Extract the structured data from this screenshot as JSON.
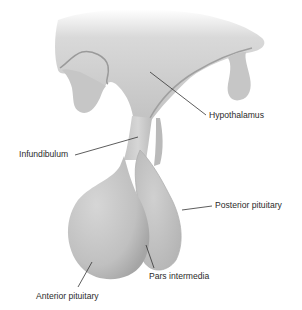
{
  "figure": {
    "type": "anatomical-illustration",
    "labels": {
      "hypothalamus": "Hypothalamus",
      "infundibulum": "Infundibulum",
      "posterior_pituitary": "Posterior pituitary",
      "pars_intermedia": "Pars intermedia",
      "anterior_pituitary": "Anterior pituitary"
    },
    "colors": {
      "tissue_light": "#d4d4d4",
      "tissue_mid": "#bdbdbd",
      "tissue_dark": "#8f8f8f",
      "leader_line": "#333333",
      "label_text": "#2b2b2b"
    }
  }
}
